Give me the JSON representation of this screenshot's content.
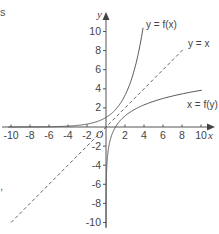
{
  "chart_data": {
    "type": "line",
    "title": "",
    "xlabel": "x",
    "ylabel": "y",
    "xlim": [
      -10,
      10
    ],
    "ylim": [
      -10,
      10
    ],
    "grid": false,
    "legend": "none (inline curve labels)",
    "x_ticks": [
      -10,
      -8,
      -6,
      -4,
      -2,
      2,
      4,
      6,
      8,
      10
    ],
    "y_ticks": [
      10,
      8,
      6,
      4,
      2,
      -2,
      -4,
      -6,
      -8,
      -10
    ],
    "origin_label": "O",
    "series": [
      {
        "name": "y = f(x)",
        "style": "solid",
        "description": "exponential-type curve, f(0)=1, reaching y=10 near x≈3.8, asymptotic to y=0 as x→-∞",
        "x": [
          -10,
          -8,
          -6,
          -4,
          -2,
          0,
          1,
          2,
          3,
          3.84
        ],
        "y": [
          0.0,
          0.01,
          0.03,
          0.09,
          0.3,
          1.0,
          1.8,
          3.3,
          6.0,
          10.0
        ]
      },
      {
        "name": "y = x",
        "style": "dashed",
        "description": "line of reflection",
        "x": [
          -10,
          10
        ],
        "y": [
          -10,
          10
        ]
      },
      {
        "name": "x = f(y)",
        "style": "solid",
        "description": "inverse (logarithmic-type) curve, passes (1,0), asymptotic to x=0 as y→-∞",
        "x": [
          0.0,
          0.01,
          0.05,
          0.3,
          1.0,
          2.0,
          4.0,
          6.0,
          8.0,
          10.0
        ],
        "y": [
          -10,
          -7.7,
          -5.0,
          -2.0,
          0.0,
          1.16,
          2.31,
          2.99,
          3.47,
          3.84
        ]
      }
    ],
    "annotations": [
      "y = f(x)",
      "y = x",
      "x = f(y)"
    ]
  },
  "labels": {
    "x_axis": "x",
    "y_axis": "y",
    "origin": "O",
    "curve_fx": "y = f(x)",
    "curve_line": "y = x",
    "curve_inverse": "x = f(y)",
    "x_ticks": [
      "-10",
      "-8",
      "-6",
      "-4",
      "-2",
      "2",
      "4",
      "6",
      "8",
      "10"
    ],
    "y_ticks": [
      "10",
      "8",
      "6",
      "4",
      "2",
      "-2",
      "-4",
      "-6",
      "-8",
      "-10"
    ]
  },
  "fragments": {
    "top_left": "s",
    "bottom_left": ","
  }
}
